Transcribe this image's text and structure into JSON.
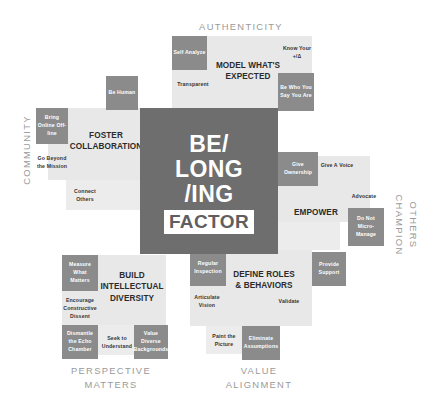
{
  "center": {
    "line1": "BE/",
    "line2": "LONG",
    "line3": "/ING",
    "line4": "FACTOR"
  },
  "axes": {
    "top": "AUTHENTICITY",
    "left": "COMMUNITY",
    "right_line1": "CHAMPION",
    "right_line2": "OTHERS",
    "bottom_left_line1": "PERSPECTIVE",
    "bottom_left_line2": "MATTERS",
    "bottom_right_line1": "VALUE",
    "bottom_right_line2": "ALIGNMENT"
  },
  "quadrants": {
    "top": {
      "title_line1": "MODEL WHAT'S",
      "title_line2": "EXPECTED",
      "items": [
        {
          "label": "Self Analyze",
          "style": "chip"
        },
        {
          "label": "Transparent",
          "style": "text"
        },
        {
          "label": "Know Your +/Δ",
          "style": "text"
        },
        {
          "label": "Be Who You Say You Are",
          "style": "chip"
        }
      ]
    },
    "left": {
      "title_line1": "FOSTER",
      "title_line2": "COLLABORATION",
      "items": [
        {
          "label": "Be Human",
          "style": "chip"
        },
        {
          "label": "Bring Online Off-line",
          "style": "chip"
        },
        {
          "label": "Go Beyond the Mission",
          "style": "text"
        },
        {
          "label": "Connect Others",
          "style": "text"
        }
      ]
    },
    "right": {
      "title_line1": "EMPOWER",
      "title_line2": "",
      "items": [
        {
          "label": "Give Ownership",
          "style": "chip"
        },
        {
          "label": "Give A Voice",
          "style": "text"
        },
        {
          "label": "Advocate",
          "style": "text"
        },
        {
          "label": "Do Not Micro-Manage",
          "style": "chip"
        },
        {
          "label": "Provide Support",
          "style": "chip"
        }
      ]
    },
    "bottom_left": {
      "title_line1": "BUILD",
      "title_line2": "INTELLECTUAL",
      "title_line3": "DIVERSITY",
      "items": [
        {
          "label": "Measure What Matters",
          "style": "chip"
        },
        {
          "label": "Encourage Constructive Dissent",
          "style": "text"
        },
        {
          "label": "Dismantle the Echo Chamber",
          "style": "chip"
        },
        {
          "label": "Seek to Understand",
          "style": "text"
        },
        {
          "label": "Value Diverse Backgrounds",
          "style": "chip"
        }
      ]
    },
    "bottom_right": {
      "title_line1": "DEFINE ROLES",
      "title_line2": "& BEHAVIORS",
      "items": [
        {
          "label": "Regular Inspection",
          "style": "chip"
        },
        {
          "label": "Articulate Vision",
          "style": "text"
        },
        {
          "label": "Validate",
          "style": "text"
        },
        {
          "label": "Paint the Picture",
          "style": "text"
        },
        {
          "label": "Eliminate Assumptions",
          "style": "chip"
        }
      ]
    }
  },
  "colors": {
    "hub": "#6e6e6e",
    "chip": "#8b8b8b",
    "panel": "#e8e8e8",
    "panel_light": "#ececec",
    "axis_text": "#9a9a9a",
    "heading_text": "#2b2b2b",
    "background": "#ffffff"
  }
}
